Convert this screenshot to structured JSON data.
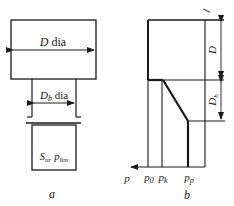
{
  "figure_a": {
    "caption": "a",
    "upper_cylinder": {
      "symbol": "D",
      "suffix": " dia"
    },
    "lower_cylinder": {
      "symbol": "D",
      "subscript": "b",
      "suffix": " dia"
    },
    "base_label": {
      "s_symbol": "S",
      "s_subscript": "nr",
      "p_symbol": "p",
      "p_subscript": "lim"
    }
  },
  "figure_b": {
    "caption": "b",
    "top_label": "l",
    "dim_upper": {
      "symbol": "D"
    },
    "dim_lower": {
      "symbol": "D",
      "subscript": "b"
    },
    "axis_label": "p",
    "ticks": [
      {
        "symbol": "p",
        "subscript": "0"
      },
      {
        "symbol": "p",
        "subscript": "k"
      },
      {
        "symbol": "p",
        "subscript": "p"
      }
    ]
  },
  "colors": {
    "ink": "#1a1a1a",
    "background": "#ffffff"
  }
}
